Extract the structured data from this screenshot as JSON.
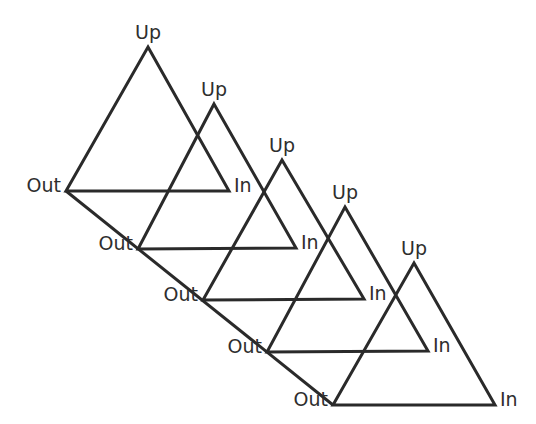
{
  "diagram": {
    "type": "cascade-of-triangles",
    "colors": {
      "line": "#2a2a2a",
      "text": "#2e2e2e",
      "background": "#ffffff"
    },
    "triangles": [
      {
        "index": 1,
        "up_label": "Up",
        "out_label": "Out",
        "in_label": "In",
        "apex": [
          148,
          47
        ],
        "left": [
          66,
          191
        ],
        "right": [
          229,
          191
        ]
      },
      {
        "index": 2,
        "up_label": "Up",
        "out_label": "Out",
        "in_label": "In",
        "apex": [
          214,
          104
        ],
        "left": [
          138,
          249
        ],
        "right": [
          296,
          248
        ]
      },
      {
        "index": 3,
        "up_label": "Up",
        "out_label": "Out",
        "in_label": "In",
        "apex": [
          282,
          160
        ],
        "left": [
          203,
          300
        ],
        "right": [
          364,
          299
        ]
      },
      {
        "index": 4,
        "up_label": "Up",
        "out_label": "Out",
        "in_label": "In",
        "apex": [
          345,
          207
        ],
        "left": [
          267,
          352
        ],
        "right": [
          428,
          351
        ]
      },
      {
        "index": 5,
        "up_label": "Up",
        "out_label": "Out",
        "in_label": "In",
        "apex": [
          414,
          263
        ],
        "left": [
          333,
          405
        ],
        "right": [
          495,
          405
        ]
      }
    ],
    "connector": {
      "description": "diagonal line joining the Out vertices",
      "from": [
        66,
        191
      ],
      "to": [
        333,
        405
      ]
    }
  }
}
